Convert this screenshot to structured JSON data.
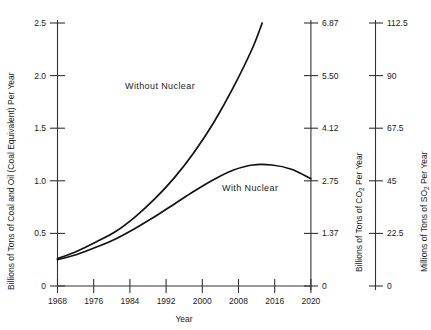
{
  "chart_data": {
    "type": "line",
    "title": "",
    "xlabel": "Year",
    "x_ticks": [
      "1968",
      "1976",
      "1984",
      "1992",
      "2000",
      "2008",
      "2016",
      "2020"
    ],
    "x_values": [
      1968,
      1976,
      1984,
      1992,
      2000,
      2008,
      2016,
      2020
    ],
    "xlim": [
      1968,
      2020
    ],
    "grid": false,
    "legend_position": "inline-annotations",
    "axes": [
      {
        "id": "primary",
        "side": "left",
        "label": "Billions of Tons of Coal and Oil (Coal Equivalent) Per Year",
        "ticks": [
          "0",
          "0.5",
          "1.0",
          "1.5",
          "2.0",
          "2.5"
        ],
        "values": [
          0,
          0.5,
          1.0,
          1.5,
          2.0,
          2.5
        ],
        "lim": [
          0,
          2.5
        ]
      },
      {
        "id": "co2",
        "side": "right",
        "label_prefix": "Billions of Tons of CO",
        "label_sub": "2",
        "label_suffix": " Per Year",
        "label": "Billions of Tons of CO2 Per Year",
        "ticks": [
          "0",
          "1.37",
          "2.75",
          "4.12",
          "5.50",
          "6.87"
        ],
        "values": [
          0,
          1.37,
          2.75,
          4.12,
          5.5,
          6.87
        ],
        "lim": [
          0,
          6.87
        ]
      },
      {
        "id": "so2",
        "side": "right",
        "label_prefix": "Millions of Tons of SO",
        "label_sub": "2",
        "label_suffix": " Per Year",
        "label": "Millions of Tons of SO2 Per Year",
        "ticks": [
          "0",
          "22.5",
          "45",
          "67.5",
          "90",
          "112.5"
        ],
        "values": [
          0,
          22.5,
          45,
          67.5,
          90,
          112.5
        ],
        "lim": [
          0,
          112.5
        ]
      }
    ],
    "series": [
      {
        "name": "Without Nuclear",
        "annotation": "Without Nuclear",
        "x": [
          1968,
          1972,
          1976,
          1980,
          1984,
          1988,
          1992,
          1996,
          2000,
          2004,
          2008,
          2010
        ],
        "values": [
          0.26,
          0.33,
          0.42,
          0.52,
          0.66,
          0.83,
          1.03,
          1.27,
          1.55,
          1.88,
          2.26,
          2.5
        ]
      },
      {
        "name": "With Nuclear",
        "annotation": "With Nuclear",
        "x": [
          1968,
          1972,
          1976,
          1980,
          1984,
          1988,
          1992,
          1996,
          2000,
          2004,
          2008,
          2012,
          2016,
          2020
        ],
        "values": [
          0.25,
          0.3,
          0.37,
          0.45,
          0.55,
          0.66,
          0.78,
          0.9,
          1.01,
          1.1,
          1.15,
          1.15,
          1.11,
          1.02
        ]
      }
    ]
  }
}
